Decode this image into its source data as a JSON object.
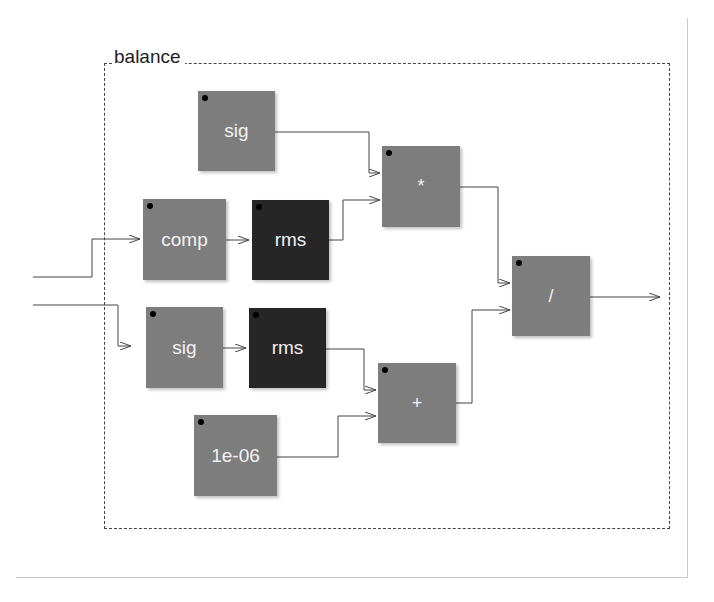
{
  "diagram": {
    "group_label": "balance",
    "colors": {
      "block_gray": "#7d7d7d",
      "block_dark": "#262626",
      "block_text": "#f2f2f2",
      "wire": "#444444",
      "dashed_border": "#444444"
    },
    "blocks": [
      {
        "id": "sig_top",
        "label": "sig",
        "style": "gray"
      },
      {
        "id": "comp",
        "label": "comp",
        "style": "gray"
      },
      {
        "id": "rms_top",
        "label": "rms",
        "style": "dark"
      },
      {
        "id": "sig_bottom",
        "label": "sig",
        "style": "gray"
      },
      {
        "id": "rms_bottom",
        "label": "rms",
        "style": "dark"
      },
      {
        "id": "const",
        "label": "1e-06",
        "style": "gray"
      },
      {
        "id": "mul",
        "label": "*",
        "style": "gray"
      },
      {
        "id": "add",
        "label": "+",
        "style": "gray"
      },
      {
        "id": "div",
        "label": "/",
        "style": "gray"
      }
    ],
    "connections": [
      {
        "from": "input_1",
        "to": "comp"
      },
      {
        "from": "input_2",
        "to": "sig_bottom"
      },
      {
        "from": "comp",
        "to": "rms_top"
      },
      {
        "from": "sig_bottom",
        "to": "rms_bottom"
      },
      {
        "from": "sig_top",
        "to": "mul"
      },
      {
        "from": "rms_top",
        "to": "mul"
      },
      {
        "from": "rms_bottom",
        "to": "add"
      },
      {
        "from": "const",
        "to": "add"
      },
      {
        "from": "mul",
        "to": "div"
      },
      {
        "from": "add",
        "to": "div"
      },
      {
        "from": "div",
        "to": "output"
      }
    ]
  }
}
